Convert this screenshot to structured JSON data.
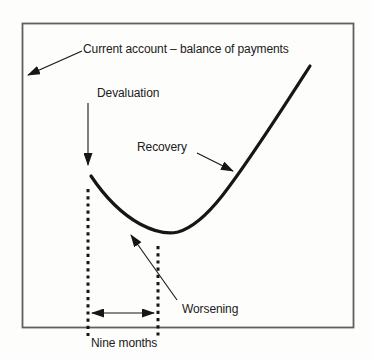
{
  "figure": {
    "title": "Current account – balance of payments",
    "labels": {
      "devaluation": "Devaluation",
      "recovery": "Recovery",
      "worsening": "Worsening",
      "nine_months": "Nine months"
    },
    "colors": {
      "background": "#fdfdfc",
      "frame": "#5f5f5f",
      "ink": "#161616",
      "text": "#202020"
    },
    "curve_points_px": [
      [
        91,
        176
      ],
      [
        122,
        212
      ],
      [
        150,
        230
      ],
      [
        168,
        234
      ],
      [
        196,
        224
      ],
      [
        222,
        196
      ],
      [
        233,
        182
      ],
      [
        270,
        125
      ],
      [
        310,
        66
      ]
    ]
  }
}
